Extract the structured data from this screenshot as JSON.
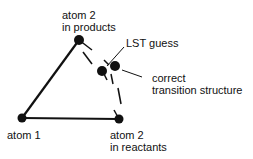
{
  "diagram": {
    "labels": {
      "atom2_products": [
        "atom 2",
        "in products"
      ],
      "atom1": "atom 1",
      "atom2_reactants": [
        "atom 2",
        "in reactants"
      ],
      "lst_guess": "LST guess",
      "correct_ts": [
        "correct",
        "transition structure"
      ]
    },
    "colors": {
      "line": "#111111",
      "background": "#ffffff"
    }
  }
}
